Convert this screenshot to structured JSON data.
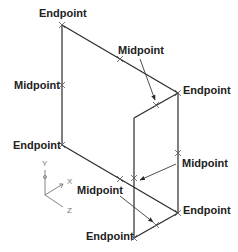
{
  "labels": {
    "endpoint_top": "Endpoint",
    "midpoint_left": "Midpoint",
    "midpoint_top_diag": "Midpoint",
    "endpoint_right_top": "Endpoint",
    "endpoint_left_bottom": "Endpoint",
    "midpoint_right": "Midpoint",
    "midpoint_center": "Midpoint",
    "endpoint_right_bottom": "Endpoint",
    "endpoint_bottom": "Endpoint"
  },
  "ucs": {
    "y_label": "Y",
    "x_label": "X",
    "z_label": "Z"
  },
  "colors": {
    "line": "#2a2a2a",
    "text": "#222222",
    "ucs": "#777777",
    "background": "#ffffff"
  }
}
